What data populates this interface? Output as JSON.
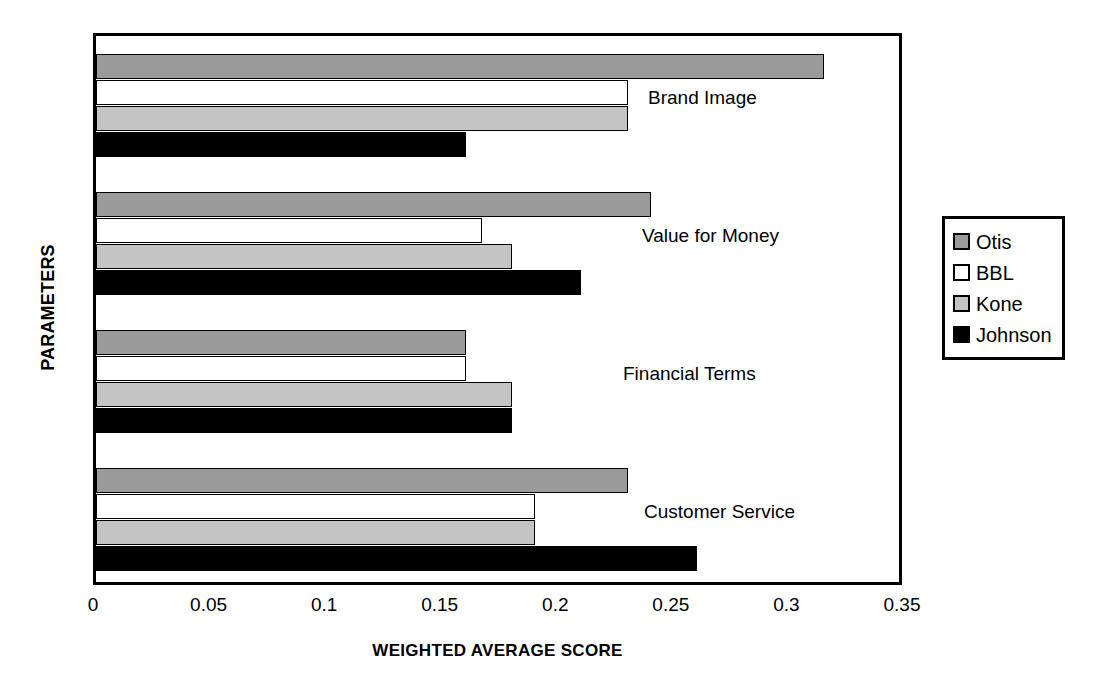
{
  "chart_data": {
    "type": "bar",
    "orientation": "horizontal",
    "title": "",
    "xlabel": "WEIGHTED AVERAGE SCORE",
    "ylabel": "PARAMETERS",
    "xlim": [
      0,
      0.35
    ],
    "xticks": [
      "0",
      "0.05",
      "0.1",
      "0.15",
      "0.2",
      "0.25",
      "0.3",
      "0.35"
    ],
    "xtick_values": [
      0,
      0.05,
      0.1,
      0.15,
      0.2,
      0.25,
      0.3,
      0.35
    ],
    "grid": false,
    "legend_position": "right",
    "categories": [
      "Brand Image",
      "Value for Money",
      "Financial Terms",
      "Customer Service"
    ],
    "series": [
      {
        "name": "Otis",
        "color": "#9a9a9a",
        "values": [
          0.315,
          0.24,
          0.16,
          0.23
        ]
      },
      {
        "name": "BBL",
        "color": "#ffffff",
        "values": [
          0.23,
          0.167,
          0.16,
          0.19
        ]
      },
      {
        "name": "Kone",
        "color": "#c4c4c4",
        "values": [
          0.23,
          0.18,
          0.18,
          0.19
        ]
      },
      {
        "name": "Johnson",
        "color": "#000000",
        "values": [
          0.16,
          0.21,
          0.18,
          0.26
        ]
      }
    ]
  },
  "legend": {
    "items": [
      {
        "label": "Otis",
        "swatch": "legend-swatch-otis"
      },
      {
        "label": "BBL",
        "swatch": "legend-swatch-bbl"
      },
      {
        "label": "Kone",
        "swatch": "legend-swatch-kone"
      },
      {
        "label": "Johnson",
        "swatch": "legend-swatch-johnson"
      }
    ]
  }
}
